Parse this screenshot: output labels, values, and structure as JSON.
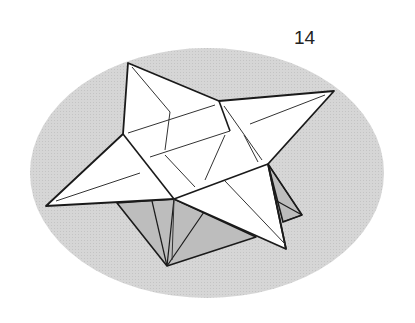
{
  "diagram": {
    "type": "origami-instruction-step",
    "step_number": "14",
    "colors": {
      "background_ellipse": "#d2d2d2",
      "paper_white": "#ffffff",
      "shaded_side": "#bdbdbd",
      "line": "#1a1a1a"
    }
  }
}
